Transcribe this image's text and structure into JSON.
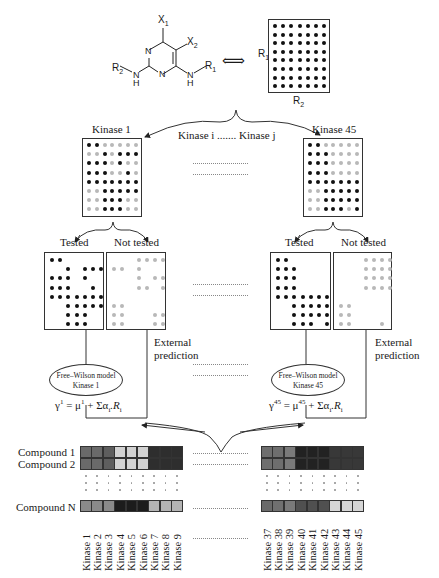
{
  "scaffold": {
    "labels": {
      "x1": "X",
      "x1_sub": "1",
      "x2": "X",
      "x2_sub": "2",
      "r1": "R",
      "r1_sub": "1",
      "r2": "R",
      "r2_sub": "2",
      "n": "N",
      "h": "H"
    },
    "equivalence_symbol": "⟺",
    "grid_labels": {
      "r1": "R",
      "r1_sub": "1",
      "r2": "R",
      "r2_sub": "2"
    },
    "grid": {
      "rows": 8,
      "cols": 7
    }
  },
  "kinase_header": {
    "middle": "Kinase i ....... Kinase j"
  },
  "panels": [
    {
      "name": "Kinase 1",
      "title": "Kinase 1",
      "grid": [
        "bbggggg",
        "ggbgbbb",
        "bbbgbgg",
        "bbbggbg",
        "bbbbbbb",
        "ggbbbbb",
        "ggbbbgg",
        "ggbbbgg"
      ],
      "tested_label": "Tested",
      "not_tested_label": "Not tested",
      "tested": [
        "bb.....",
        "..b.bbb",
        "bbb.b..",
        "bbb..b.",
        "bbbbbbb",
        "..bbbbb",
        "..bbb..",
        "..bbb.."
      ],
      "not_tested": [
        "...gggg",
        "gg.g...",
        "...g.gg",
        "...gg.g",
        ".......",
        "gg.....",
        "gg...gg",
        "gg...gg"
      ],
      "external_prediction": [
        "External",
        "prediction"
      ],
      "model": {
        "line1": "Free–Wilson model",
        "line2": "Kinase 1"
      },
      "equation": {
        "y": "γ",
        "sup": "1",
        "mu": "μ",
        "mu_sup": "1",
        "rest": "+ Σα",
        "sub_i": "i",
        "dotR": ".R",
        "sub_i2": "i"
      }
    },
    {
      "name": "Kinase 45",
      "title": "Kinase 45",
      "grid": [
        "bbggggg",
        "bbbgggg",
        "bbbgggg",
        "bbbgggg",
        "bbbbbbb",
        "ggbbbbb",
        "ggbbbbb",
        "ggbbbgb"
      ],
      "tested_label": "Tested",
      "not_tested_label": "Not tested",
      "tested": [
        "bb.....",
        "bbb....",
        "bbb....",
        "bbb....",
        "bbbbbbb",
        "..bbbbb",
        "..bbbbb",
        "..bbb.b"
      ],
      "not_tested": [
        "...gggg",
        "...gggg",
        "...gggg",
        "...gggg",
        ".......",
        "gg.....",
        "gg.....",
        "gg...g."
      ],
      "external_prediction": [
        "External",
        "prediction"
      ],
      "model": {
        "line1": "Free–Wilson model",
        "line2": "Kinase 45"
      },
      "equation": {
        "y": "γ",
        "sup": "45",
        "mu": "μ",
        "mu_sup": "45",
        "rest": "+ Σα",
        "sub_i": "i",
        "dotR": ".R",
        "sub_i2": "i"
      }
    }
  ],
  "heatmap": {
    "row_labels": [
      "Compound 1",
      "Compound 2",
      "Compound N"
    ],
    "left": {
      "columns": [
        "Kinase 1",
        "Kinase 2",
        "Kinase 3",
        "Kinase 4",
        "Kinase 5",
        "Kinase 6",
        "Kinase 7",
        "Kinase 8",
        "Kinase 9"
      ],
      "rows": [
        [
          "#6a6a6a",
          "#6a6a6a",
          "#5e5e5e",
          "#d2d2d2",
          "#d2d2d2",
          "#d2d2d2",
          "#2e2e2e",
          "#2e2e2e",
          "#2e2e2e"
        ],
        [
          "#6a6a6a",
          "#6a6a6a",
          "#5e5e5e",
          "#d2d2d2",
          "#d2d2d2",
          "#d2d2d2",
          "#2e2e2e",
          "#2e2e2e",
          "#2e2e2e"
        ],
        [
          "#8a8a8a",
          "#8a8a8a",
          "#8a8a8a",
          "#1c1c1c",
          "#1c1c1c",
          "#1c1c1c",
          "#b4b4b4",
          "#b4b4b4",
          "#b4b4b4"
        ]
      ]
    },
    "right": {
      "columns": [
        "Kinase 37",
        "Kinase 38",
        "Kinase 39",
        "Kinase 40",
        "Kinase 41",
        "Kinase 42",
        "Kinase 43",
        "Kinase 44",
        "Kinase 45"
      ],
      "rows": [
        [
          "#6e6e6e",
          "#6e6e6e",
          "#7a7a7a",
          "#222222",
          "#222222",
          "#222222",
          "#383838",
          "#383838",
          "#383838"
        ],
        [
          "#6e6e6e",
          "#6e6e6e",
          "#7a7a7a",
          "#222222",
          "#222222",
          "#222222",
          "#383838",
          "#383838",
          "#383838"
        ],
        [
          "#6a6a6a",
          "#707070",
          "#7a7a7a",
          "#505050",
          "#505050",
          "#505050",
          "#d6d6d6",
          "#d6d6d6",
          "#d6d6d6"
        ]
      ]
    }
  }
}
